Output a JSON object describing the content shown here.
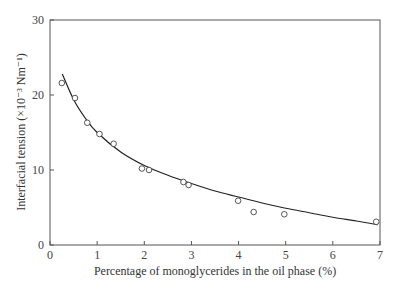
{
  "chart_data": {
    "type": "scatter",
    "title": "",
    "xlabel": "Percentage of monoglycerides in the oil phase (%)",
    "ylabel": "Interfacial tension (×10⁻³ Nm⁻¹)",
    "xlim": [
      0,
      7
    ],
    "ylim": [
      0,
      30
    ],
    "x_ticks": [
      0,
      1,
      2,
      3,
      4,
      5,
      6,
      7
    ],
    "y_ticks": [
      0,
      10,
      20,
      30
    ],
    "grid": false,
    "legend": null,
    "series": [
      {
        "name": "measured",
        "marker": "open-circle",
        "x": [
          0.25,
          0.53,
          0.79,
          1.05,
          1.35,
          1.95,
          2.1,
          2.83,
          2.94,
          3.99,
          4.32,
          4.97,
          6.92
        ],
        "y": [
          21.6,
          19.6,
          16.3,
          14.8,
          13.5,
          10.2,
          10.0,
          8.4,
          8.0,
          5.9,
          4.4,
          4.1,
          3.1
        ]
      },
      {
        "name": "fitted curve",
        "style": "line",
        "x": [
          0.26,
          0.5,
          0.75,
          1.0,
          1.5,
          2.0,
          2.5,
          3.0,
          3.5,
          4.0,
          4.5,
          5.0,
          5.5,
          6.0,
          6.5,
          6.95
        ],
        "y": [
          22.8,
          19.4,
          16.9,
          15.0,
          12.4,
          10.6,
          9.3,
          8.2,
          7.2,
          6.4,
          5.6,
          4.9,
          4.3,
          3.7,
          3.2,
          2.7
        ]
      }
    ]
  }
}
